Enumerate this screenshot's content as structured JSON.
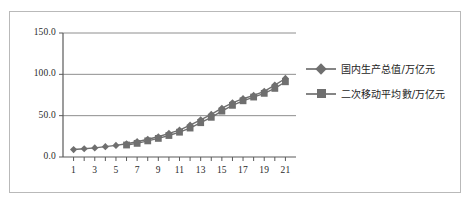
{
  "chart_data": {
    "type": "line",
    "title": "",
    "xlabel": "",
    "ylabel": "",
    "xlim": [
      0,
      22
    ],
    "ylim": [
      0,
      150
    ],
    "grid": true,
    "legend_position": "right",
    "y_ticks": [
      "0.0",
      "50.0",
      "100.0",
      "150.0"
    ],
    "y_tick_values": [
      0,
      50,
      100,
      150
    ],
    "x_ticks": [
      "1",
      "3",
      "5",
      "7",
      "9",
      "11",
      "13",
      "15",
      "17",
      "19",
      "21"
    ],
    "x_tick_values": [
      1,
      3,
      5,
      7,
      9,
      11,
      13,
      15,
      17,
      19,
      21
    ],
    "x": [
      1,
      2,
      3,
      4,
      5,
      6,
      7,
      8,
      9,
      10,
      11,
      12,
      13,
      14,
      15,
      16,
      17,
      18,
      19,
      20,
      21
    ],
    "series": [
      {
        "name": "国内生产总值/万亿元",
        "marker": "diamond",
        "color": "#6f6f6f",
        "values": [
          9.0,
          10.0,
          11.0,
          12.5,
          14.0,
          16.0,
          18.5,
          21.5,
          24.5,
          28.5,
          32.5,
          38.5,
          45.0,
          51.5,
          59.0,
          65.5,
          70.5,
          74.5,
          79.5,
          87.0,
          95.0
        ]
      },
      {
        "name": "二次移动平均數/万亿元",
        "marker": "square",
        "color": "#6f6f6f",
        "values": [
          null,
          null,
          null,
          null,
          null,
          14.5,
          16.5,
          19.5,
          22.5,
          26.0,
          30.0,
          35.0,
          41.5,
          48.0,
          55.5,
          62.5,
          68.0,
          72.5,
          77.0,
          83.0,
          91.0
        ]
      }
    ]
  },
  "legend": {
    "items": [
      {
        "label": "国内生产总值/万亿元",
        "marker": "diamond"
      },
      {
        "label": "二次移动平均數/万亿元",
        "marker": "square"
      }
    ]
  }
}
